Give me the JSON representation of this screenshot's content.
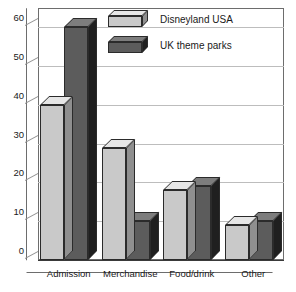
{
  "chart_data": {
    "type": "bar",
    "title": "",
    "xlabel": "",
    "ylabel": "",
    "categories": [
      "Admission",
      "Merchandise",
      "Food/drink",
      "Other"
    ],
    "series": [
      {
        "name": "Disneyland USA",
        "values": [
          40,
          29,
          18,
          9
        ],
        "color": "#c9c9c9"
      },
      {
        "name": "UK theme parks",
        "values": [
          60,
          10,
          19,
          10
        ],
        "color": "#5c5c5c"
      }
    ],
    "ylim": [
      0,
      65
    ],
    "yticks": [
      0,
      10,
      20,
      30,
      40,
      50,
      60
    ],
    "ytick_labels": [
      "0",
      "10",
      "20",
      "30",
      "40",
      "50",
      "60"
    ],
    "grid": true,
    "legend_position": "top-center",
    "style": "3d-clustered-column"
  },
  "legend": {
    "items": [
      {
        "label": "Disneyland USA"
      },
      {
        "label": "UK theme parks"
      }
    ]
  },
  "colors": {
    "series_light": "#c9c9c9",
    "series_dark": "#5c5c5c",
    "gridline": "#bdbdbd",
    "frame": "#6d6d6d",
    "text": "#1a1a1a",
    "background": "#ffffff"
  },
  "top_fragment": ""
}
